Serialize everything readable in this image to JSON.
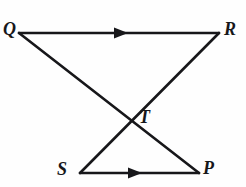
{
  "figure": {
    "kind": "geometry-diagram",
    "width": 246,
    "height": 187,
    "background_color": "#fefefe",
    "stroke_color": "#17171a",
    "stroke_width": 2.6,
    "label_color": "#17171a",
    "points": {
      "Q": {
        "label": "Q",
        "x": 19,
        "y": 33
      },
      "R": {
        "label": "R",
        "x": 219,
        "y": 33
      },
      "T": {
        "label": "T",
        "x": 131,
        "y": 121
      },
      "S": {
        "label": "S",
        "x": 80,
        "y": 173
      },
      "P": {
        "label": "P",
        "x": 199,
        "y": 173
      }
    },
    "segments": [
      {
        "name": "segment-QR",
        "from": "Q",
        "to": "R",
        "x1": 19,
        "y1": 33,
        "x2": 219,
        "y2": 33,
        "has_arrow_marker": true,
        "arrow_at_x": 123,
        "arrow_at_y": 33,
        "arrow_direction": "right"
      },
      {
        "name": "segment-SP",
        "from": "S",
        "to": "P",
        "x1": 80,
        "y1": 173,
        "x2": 199,
        "y2": 173,
        "has_arrow_marker": true,
        "arrow_at_x": 137,
        "arrow_at_y": 173,
        "arrow_direction": "right"
      },
      {
        "name": "segment-QP",
        "from": "Q",
        "to": "P",
        "x1": 19,
        "y1": 33,
        "x2": 199,
        "y2": 173,
        "has_arrow_marker": false
      },
      {
        "name": "segment-SR",
        "from": "S",
        "to": "R",
        "x1": 80,
        "y1": 173,
        "x2": 219,
        "y2": 33,
        "has_arrow_marker": false
      }
    ],
    "labels": [
      {
        "name": "vertex-label-Q",
        "text": "Q"
      },
      {
        "name": "vertex-label-R",
        "text": "R"
      },
      {
        "name": "vertex-label-T",
        "text": "T"
      },
      {
        "name": "vertex-label-S",
        "text": "S"
      },
      {
        "name": "vertex-label-P",
        "text": "P"
      }
    ]
  }
}
